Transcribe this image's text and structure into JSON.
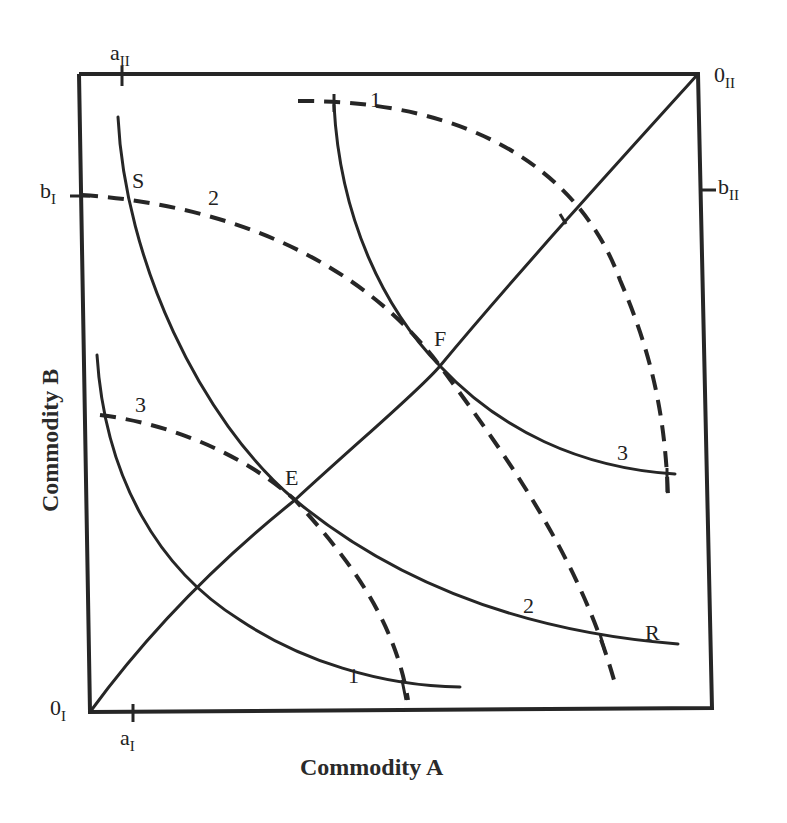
{
  "diagram": {
    "x_axis_title": "Commodity A",
    "y_axis_title": "Commodity B",
    "origins": {
      "group_I": {
        "base": "0",
        "sub": "I"
      },
      "group_II": {
        "base": "0",
        "sub": "II"
      }
    },
    "endowment_ticks": {
      "a_I": {
        "base": "a",
        "sub": "I"
      },
      "a_II": {
        "base": "a",
        "sub": "II"
      },
      "b_I": {
        "base": "b",
        "sub": "I"
      },
      "b_II": {
        "base": "b",
        "sub": "II"
      }
    },
    "points": {
      "S": "S",
      "R": "R",
      "E": "E",
      "F": "F"
    },
    "curve_labels": {
      "solid_1": "1",
      "solid_2": "2",
      "solid_3": "3",
      "dashed_1": "1",
      "dashed_2": "2",
      "dashed_3": "3"
    },
    "legend": {
      "solid": "Indifference curves of group I (origin 0_I)",
      "dashed": "Indifference curves of group II (origin 0_II)"
    },
    "colors": {
      "ink": "#262626",
      "background": "#ffffff"
    }
  }
}
